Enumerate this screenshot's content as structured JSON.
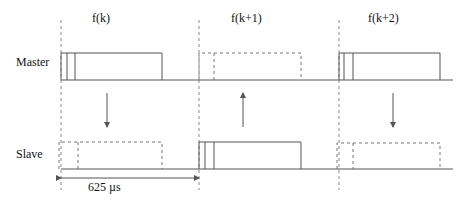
{
  "diagram": {
    "type": "timing-diagram",
    "rows": [
      {
        "id": "master",
        "label": "Master"
      },
      {
        "id": "slave",
        "label": "Slave"
      }
    ],
    "slots": [
      {
        "label": "f(k)",
        "master": "transmit",
        "slave": "receive",
        "direction": "master-to-slave"
      },
      {
        "label": "f(k+1)",
        "master": "receive",
        "slave": "transmit",
        "direction": "slave-to-master"
      },
      {
        "label": "f(k+2)",
        "master": "transmit",
        "slave": "receive",
        "direction": "master-to-slave"
      }
    ],
    "duration_label": "625 µs",
    "legend": {
      "solid_box": "transmit",
      "dashed_box": "receive"
    },
    "colors": {
      "line": "#555555",
      "dashed": "#777777",
      "text": "#111111"
    }
  }
}
